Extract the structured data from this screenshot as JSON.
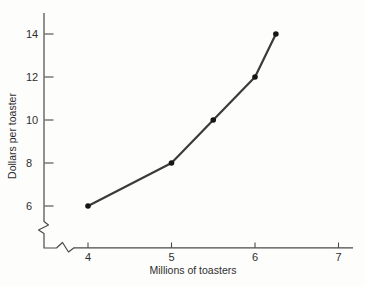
{
  "chart_data": {
    "type": "line",
    "title": "",
    "xlabel": "Millions of toasters",
    "ylabel": "Dollars per toaster",
    "x": [
      4,
      5,
      5.5,
      6,
      6.25
    ],
    "y": [
      6,
      8,
      10,
      12,
      14
    ],
    "x_ticks": [
      "4",
      "5",
      "6",
      "7"
    ],
    "y_ticks": [
      "6",
      "8",
      "10",
      "12",
      "14"
    ],
    "x_tick_values": [
      4,
      5,
      6,
      7
    ],
    "y_tick_values": [
      6,
      8,
      10,
      12,
      14
    ],
    "xlim": [
      3.5,
      7.2
    ],
    "ylim": [
      4,
      15
    ],
    "axis_break": {
      "x": true,
      "y": true
    },
    "grid": false,
    "legend": false,
    "line_color": "#3b3b3b",
    "marker_color": "#161616",
    "axis_color": "#4a4a4a",
    "text_color": "#2e2e2e",
    "background_color": "#fdfdfc"
  }
}
